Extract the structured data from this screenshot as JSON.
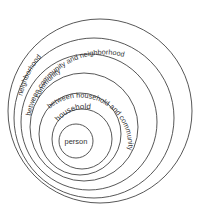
{
  "diagram": {
    "type": "nested-circles",
    "stroke_color": "#444444",
    "text_color": "#333333",
    "background": "#ffffff",
    "levels": [
      {
        "label": "neighborhood",
        "cx": 100,
        "cy": 111,
        "r": 92
      },
      {
        "label": "between community and neighborhood",
        "cx": 94,
        "cy": 118,
        "r": 80
      },
      {
        "label": "community",
        "cx": 89,
        "cy": 122,
        "r": 68
      },
      {
        "label": "between household and community",
        "cx": 84,
        "cy": 127,
        "r": 54
      },
      {
        "label": "household",
        "cx": 80,
        "cy": 134,
        "r": 41
      },
      {
        "label": "",
        "cx": 82,
        "cy": 139,
        "r": 30
      },
      {
        "label": "person",
        "cx": 76,
        "cy": 141,
        "r": 17
      }
    ]
  }
}
